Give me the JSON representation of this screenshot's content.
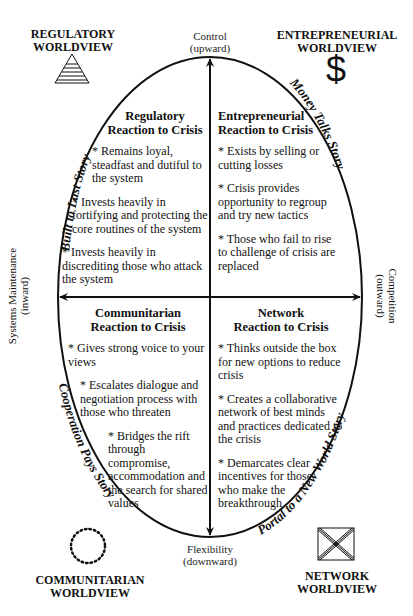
{
  "worldviews": {
    "regulatory": {
      "line1": "REGULATORY",
      "line2": "WORLDVIEW",
      "icon": "stepped-pyramid-icon"
    },
    "entrepreneurial": {
      "line1": "ENTREPRENEURIAL",
      "line2": "WORLDVIEW",
      "icon": "dollar-sign-icon",
      "glyph": "$"
    },
    "communitarian": {
      "line1": "COMMUNITARIAN",
      "line2": "WORLDVIEW",
      "icon": "dotted-circle-icon"
    },
    "network": {
      "line1": "NETWORK",
      "line2": "WORLDVIEW",
      "icon": "crossed-box-icon"
    }
  },
  "axes": {
    "top": {
      "line1": "Control",
      "line2": "(upward)"
    },
    "bottom": {
      "line1": "Flexibility",
      "line2": "(downward)"
    },
    "left": {
      "line1": "Systems Maintenance",
      "line2": "(inward)"
    },
    "right": {
      "line1": "Competition",
      "line2": "(outward)"
    }
  },
  "stories": {
    "top_left": "Built to Last Story",
    "top_right": "Money Talks Story",
    "bottom_left": "Cooperation Pays Story",
    "bottom_right": "Portal to a New World Story"
  },
  "quadrants": {
    "regulatory": {
      "title1": "Regulatory",
      "title2": "Reaction to Crisis",
      "bullets": [
        "* Remains loyal, steadfast and dutiful to the system",
        "* Invests heavily in fortifying and protecting the core routines of the system",
        "* Invests heavily in discrediting those who attack the system"
      ]
    },
    "entrepreneurial": {
      "title1": "Entrepreneurial",
      "title2": "Reaction to Crisis",
      "bullets": [
        "* Exists by selling or cutting losses",
        "* Crisis provides opportunity to regroup and try new tactics",
        "* Those who fail to rise to challenge of crisis are replaced"
      ]
    },
    "communitarian": {
      "title1": "Communitarian",
      "title2": "Reaction to Crisis",
      "bullets": [
        "* Gives strong voice to your views",
        "* Escalates dialogue and negotiation process with those who threaten",
        "* Bridges the rift through compromise, accommodation and the search for shared values"
      ]
    },
    "network": {
      "title1": "Network",
      "title2": "Reaction to Crisis",
      "bullets": [
        "* Thinks outside the box for new options to reduce crisis",
        "* Creates a collaborative network of best minds and practices dedicated to the crisis",
        "* Demarcates clear incentives for those who make the breakthrough"
      ]
    }
  },
  "colors": {
    "ink": "#111111",
    "background": "#ffffff"
  }
}
